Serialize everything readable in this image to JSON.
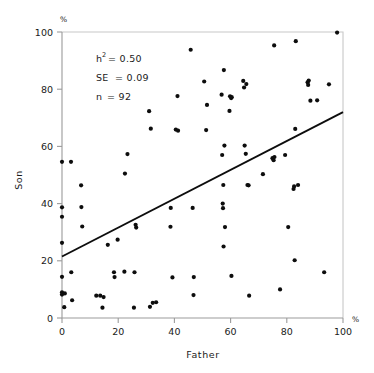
{
  "figure": {
    "background_color": "#ffffff",
    "point_color": "#0d0d0d",
    "axis_color": "#9b9b9b",
    "line_color": "#0d0d0d"
  },
  "annotations": {
    "heritability_label": "h",
    "heritability_sup": "2",
    "heritability_value": "= 0.50",
    "se_label": "SE",
    "se_value": "= 0.09",
    "n_label": "n",
    "n_value": "= 92"
  },
  "chart_data": {
    "type": "scatter",
    "title": "",
    "xlabel": "Father",
    "ylabel": "Son",
    "x_unit": "%",
    "y_unit": "%",
    "xlim": [
      0,
      100
    ],
    "ylim": [
      0,
      100
    ],
    "xticks": [
      0,
      20,
      40,
      60,
      80,
      100
    ],
    "yticks": [
      0,
      20,
      40,
      60,
      80,
      100
    ],
    "xtick_labels": [
      "0",
      "20",
      "40",
      "60",
      "80",
      "100"
    ],
    "ytick_labels": [
      "0",
      "20",
      "40",
      "60",
      "80",
      "100"
    ],
    "grid": false,
    "legend": "none",
    "n_points": 92,
    "heritability": 0.5,
    "standard_error": 0.09,
    "fit_line": {
      "type": "regression",
      "x_start": 0,
      "y_start": 21.5,
      "x_end": 100,
      "y_end": 72.0,
      "slope": 0.505,
      "intercept": 21.5
    },
    "points": [
      [
        0.0,
        54.6
      ],
      [
        0.0,
        38.7
      ],
      [
        0.0,
        35.4
      ],
      [
        0.0,
        26.3
      ],
      [
        0.0,
        14.4
      ],
      [
        0.0,
        9.0
      ],
      [
        0.0,
        8.2
      ],
      [
        0.8,
        3.8
      ],
      [
        3.2,
        54.6
      ],
      [
        3.3,
        16.0
      ],
      [
        3.6,
        6.2
      ],
      [
        6.8,
        46.4
      ],
      [
        6.9,
        38.8
      ],
      [
        7.2,
        32.0
      ],
      [
        12.2,
        7.8
      ],
      [
        13.6,
        7.8
      ],
      [
        14.4,
        3.6
      ],
      [
        14.8,
        7.3
      ],
      [
        16.3,
        25.6
      ],
      [
        18.5,
        16.0
      ],
      [
        18.7,
        14.3
      ],
      [
        19.8,
        27.4
      ],
      [
        22.2,
        16.2
      ],
      [
        22.4,
        50.5
      ],
      [
        23.3,
        57.3
      ],
      [
        25.6,
        3.6
      ],
      [
        25.8,
        16.0
      ],
      [
        26.2,
        32.6
      ],
      [
        26.4,
        31.6
      ],
      [
        31.0,
        72.3
      ],
      [
        31.3,
        3.9
      ],
      [
        31.6,
        66.2
      ],
      [
        32.3,
        5.3
      ],
      [
        33.5,
        5.5
      ],
      [
        38.6,
        31.9
      ],
      [
        38.7,
        38.5
      ],
      [
        39.3,
        14.2
      ],
      [
        40.5,
        65.9
      ],
      [
        41.1,
        77.6
      ],
      [
        41.3,
        65.5
      ],
      [
        45.8,
        93.8
      ],
      [
        46.5,
        38.5
      ],
      [
        46.8,
        8.0
      ],
      [
        46.9,
        14.3
      ],
      [
        50.6,
        82.7
      ],
      [
        51.3,
        65.7
      ],
      [
        51.6,
        74.5
      ],
      [
        56.8,
        78.1
      ],
      [
        57.0,
        57.0
      ],
      [
        57.2,
        40.0
      ],
      [
        57.3,
        38.4
      ],
      [
        57.4,
        46.5
      ],
      [
        57.5,
        25.0
      ],
      [
        57.6,
        86.7
      ],
      [
        57.8,
        60.3
      ],
      [
        58.0,
        31.8
      ],
      [
        59.6,
        72.4
      ],
      [
        59.8,
        77.5
      ],
      [
        60.2,
        76.9
      ],
      [
        60.3,
        14.7
      ],
      [
        64.5,
        82.9
      ],
      [
        64.8,
        80.6
      ],
      [
        65.0,
        60.3
      ],
      [
        65.4,
        57.4
      ],
      [
        65.6,
        81.8
      ],
      [
        66.0,
        46.5
      ],
      [
        66.4,
        46.4
      ],
      [
        66.6,
        7.8
      ],
      [
        71.5,
        50.3
      ],
      [
        74.9,
        55.9
      ],
      [
        75.3,
        55.2
      ],
      [
        75.5,
        95.3
      ],
      [
        77.6,
        10.0
      ],
      [
        79.4,
        57.0
      ],
      [
        80.5,
        31.8
      ],
      [
        82.4,
        45.1
      ],
      [
        82.6,
        46.0
      ],
      [
        82.8,
        20.2
      ],
      [
        83.0,
        66.1
      ],
      [
        83.2,
        96.8
      ],
      [
        84.0,
        46.5
      ],
      [
        87.4,
        82.4
      ],
      [
        87.6,
        81.5
      ],
      [
        87.8,
        83.0
      ],
      [
        88.4,
        76.0
      ],
      [
        90.8,
        76.1
      ],
      [
        93.3,
        16.0
      ],
      [
        95.0,
        81.7
      ],
      [
        97.9,
        99.8
      ],
      [
        1.0,
        8.6
      ],
      [
        60.4,
        77.2
      ],
      [
        75.6,
        56.3
      ]
    ]
  }
}
